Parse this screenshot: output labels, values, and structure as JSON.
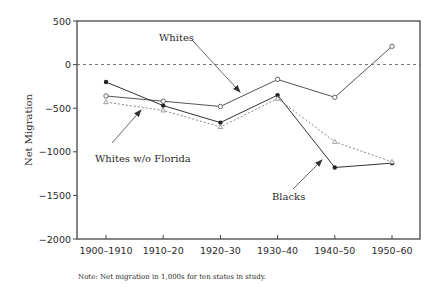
{
  "chart_data": {
    "type": "line",
    "title": "",
    "xlabel": "",
    "ylabel": "Net Migration",
    "ylim": [
      -2000,
      500
    ],
    "yticks": [
      500,
      0,
      -500,
      -1000,
      -1500,
      -2000
    ],
    "grid": false,
    "reference_line": {
      "y": 0,
      "style": "dashed"
    },
    "categories": [
      "1900–1910",
      "1910–20",
      "1920–30",
      "1930–40",
      "1940–50",
      "1950–60"
    ],
    "series": [
      {
        "name": "Whites",
        "marker": "open-circle",
        "line": "solid",
        "values": [
          -360,
          -420,
          -480,
          -170,
          -375,
          210
        ]
      },
      {
        "name": "Blacks",
        "marker": "filled-circle",
        "line": "solid",
        "values": [
          -200,
          -470,
          -665,
          -350,
          -1180,
          -1130
        ]
      },
      {
        "name": "Whites w/o Florida",
        "marker": "open-triangle",
        "line": "dotted/dashed",
        "values": [
          -430,
          -525,
          -715,
          -390,
          -885,
          -1115
        ]
      }
    ],
    "annotations": [
      {
        "text": "Whites",
        "points_to": "Whites series near 1920–30"
      },
      {
        "text": "Whites w/o Florida",
        "points_to": "Whites w/o Florida series near 1910–20"
      },
      {
        "text": "Blacks",
        "points_to": "Blacks series near 1940–50"
      }
    ],
    "note": "Note: Net migration in 1,000s for ten states in study."
  },
  "labels": {
    "ylabel": "Net Migration",
    "ann_whites": "Whites",
    "ann_whites_wo_florida": "Whites w/o Florida",
    "ann_blacks": "Blacks",
    "note": "Note: Net migration in 1,000s for ten states in study."
  },
  "colors": {
    "axis": "#333333",
    "whites": "#555555",
    "blacks": "#333333",
    "whites_wo_florida": "#888888"
  }
}
